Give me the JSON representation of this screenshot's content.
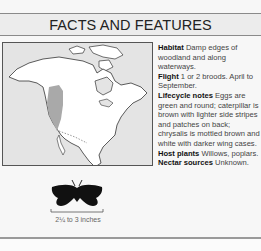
{
  "header": {
    "title": "FACTS AND FEATURES"
  },
  "map": {
    "region": "North America",
    "range_color": "#a9a9a9",
    "land_color": "#ffffff",
    "water_color": "#e4e4e4"
  },
  "facts": [
    {
      "label": "Habitat",
      "text": "Damp edges of woodland and along waterways."
    },
    {
      "label": "Flight",
      "text": "1 or 2 broods. April to September."
    },
    {
      "label": "Lifecycle notes",
      "text": "Eggs are green and round; caterpillar is brown with lighter side stripes and patches on back; chrysalis is mottled brown and white with darker wing cases."
    },
    {
      "label": "Host plants",
      "text": "Willows, poplars."
    },
    {
      "label": "Nectar sources",
      "text": "Unknown."
    }
  ],
  "size": {
    "icon": "butterfly-silhouette-icon",
    "label": "2¼ to 3 inches"
  }
}
